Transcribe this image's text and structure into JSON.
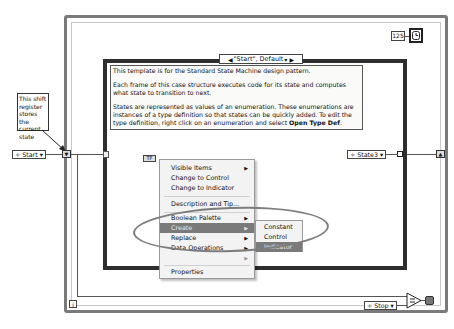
{
  "diagram": {
    "type": "LabVIEW block diagram - Standard State Machine template",
    "colors": {
      "loop_border": "#7a7a7a",
      "case_border": "#2e2e2e",
      "menu_highlight": "#7a7a7a",
      "ellipse": "#7d7d7d"
    }
  },
  "note": {
    "text": "This shift register stores the current state"
  },
  "initial_state": {
    "value": "Start"
  },
  "case_selector": {
    "label": "\"Start\", Default"
  },
  "comment": {
    "line1": "This template is for the Standard State Machine design pattern.",
    "line2": "Each frame of this case structure executes code for its state and computes what state to transition to next.",
    "line3_prefix": "States are represented as values of an enumeration. These enumerations are instances of a type definition so that states can be quickly added. To edit the type definition, right click on an enumeration and select ",
    "line3_bold": "Open Type Def",
    "line3_suffix": "."
  },
  "next_state": {
    "value": "State3"
  },
  "stop_constant": {
    "value": "Stop"
  },
  "wait_constant": {
    "value": "125"
  },
  "iteration_terminal": {
    "label": "i"
  },
  "context_menu": {
    "items": [
      {
        "label": "Visible Items",
        "submenu": true
      },
      {
        "label": "Change to Control",
        "submenu": false
      },
      {
        "label": "Change to Indicator",
        "submenu": false
      },
      {
        "label": "Description and Tip...",
        "submenu": false
      },
      {
        "label": "Boolean Palette",
        "submenu": true
      },
      {
        "label": "Create",
        "submenu": true,
        "highlighted": true
      },
      {
        "label": "Replace",
        "submenu": true
      },
      {
        "label": "Data Operations",
        "submenu": true
      },
      {
        "label": "Advanced",
        "submenu": true,
        "dimmed": true
      },
      {
        "label": "Properties",
        "submenu": false
      }
    ]
  },
  "create_submenu": {
    "items": [
      {
        "label": "Constant"
      },
      {
        "label": "Control"
      },
      {
        "label": "Indicator",
        "highlighted": true
      }
    ]
  }
}
